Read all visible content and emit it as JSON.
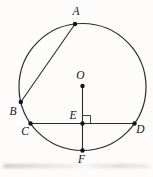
{
  "figure": {
    "colors": {
      "background": "#fdfcfb",
      "stroke": "#2b2b2b",
      "point": "#141414",
      "label": "#111111",
      "artifact_gray": "#a9a9a9"
    },
    "circle": {
      "cx": 82.5,
      "cy": 87,
      "r": 63.5
    },
    "points": {
      "O": {
        "label": "O",
        "x": 82.5,
        "y": 86,
        "lx": 80.5,
        "ly": 79
      },
      "A": {
        "label": "A",
        "x": 75,
        "y": 24,
        "lx": 76,
        "ly": 15
      },
      "B": {
        "label": "B",
        "x": 20.8,
        "y": 102,
        "lx": 13,
        "ly": 115
      },
      "C": {
        "label": "C",
        "x": 30.5,
        "y": 123.5,
        "lx": 25,
        "ly": 135
      },
      "D": {
        "label": "D",
        "x": 134.5,
        "y": 123.5,
        "lx": 140.5,
        "ly": 133
      },
      "E": {
        "label": "E",
        "x": 82.5,
        "y": 123.5,
        "lx": 73,
        "ly": 119
      },
      "F": {
        "label": "F",
        "x": 82.5,
        "y": 150.5,
        "lx": 81.5,
        "ly": 163
      }
    },
    "segments": [
      {
        "from": "A",
        "to": "B"
      },
      {
        "from": "C",
        "to": "D"
      },
      {
        "from": "O",
        "to": "F"
      }
    ],
    "right_angle_marker": {
      "at": "E",
      "size": 8
    },
    "dot_radius": 2.2
  }
}
